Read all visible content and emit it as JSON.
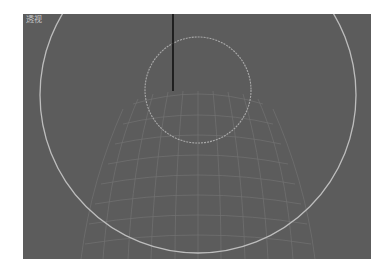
{
  "viewport": {
    "label": "透视",
    "background": "#5c5c5c",
    "objects": {
      "large_circle": {
        "cx": 175,
        "cy": 81,
        "r": 158,
        "color": "#bdbdbd"
      },
      "small_circle": {
        "cx": 175,
        "cy": 76,
        "r": 53,
        "color": "#a9a9a9"
      },
      "vertical_line": {
        "x": 150,
        "y1": 0,
        "y2": 77,
        "color": "#111111"
      },
      "mesh_color": "#7a7a7a"
    }
  }
}
